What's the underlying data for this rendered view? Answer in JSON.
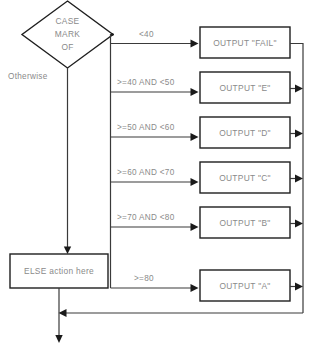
{
  "diagram": {
    "type": "flowchart",
    "decision": {
      "line1": "CASE",
      "line2": "MARK",
      "line3": "OF"
    },
    "default_branch_label": "Otherwise",
    "else_action": "ELSE action here",
    "branches": [
      {
        "condition": "<40",
        "output": "OUTPUT \"FAIL\""
      },
      {
        "condition": ">=40 AND <50",
        "output": "OUTPUT \"E\""
      },
      {
        "condition": ">=50 AND <60",
        "output": "OUTPUT \"D\""
      },
      {
        "condition": ">=60 AND <70",
        "output": "OUTPUT \"C\""
      },
      {
        "condition": ">=70 AND <80",
        "output": "OUTPUT \"B\""
      },
      {
        "condition": ">=80",
        "output": "OUTPUT \"A\""
      }
    ],
    "colors": {
      "background": "#ffffff",
      "shape_border": "#1f1f1f",
      "connector": "#3a3a3a",
      "text": "#8a8a8a",
      "arrow": "#1a1a1a"
    }
  }
}
